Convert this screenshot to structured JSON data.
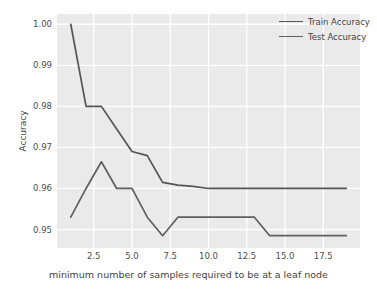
{
  "chart_data": {
    "type": "line",
    "title": "",
    "xlabel": "minimum number of samples required to be at a leaf node",
    "ylabel": "Accuracy",
    "xlim": [
      0.1,
      19.9
    ],
    "ylim": [
      0.9455,
      1.0025
    ],
    "grid": true,
    "legend_position": "upper right",
    "background": "#eaeaea",
    "gridline_color": "#ffffff",
    "xticks": [
      2.5,
      5.0,
      7.5,
      10.0,
      12.5,
      15.0,
      17.5
    ],
    "xtick_labels": [
      "2.5",
      "5.0",
      "7.5",
      "10.0",
      "12.5",
      "15.0",
      "17.5"
    ],
    "yticks": [
      0.95,
      0.96,
      0.97,
      0.98,
      0.99,
      1.0
    ],
    "ytick_labels": [
      "0.95",
      "0.96",
      "0.97",
      "0.98",
      "0.99",
      "1.00"
    ],
    "x": [
      1,
      2,
      3,
      4,
      5,
      6,
      7,
      8,
      9,
      10,
      11,
      12,
      13,
      14,
      15,
      16,
      17,
      18,
      19
    ],
    "series": [
      {
        "name": "Train Accuracy",
        "color": "#555555",
        "values": [
          1.0,
          0.98,
          0.98,
          0.9745,
          0.969,
          0.968,
          0.9615,
          0.9608,
          0.9605,
          0.96,
          0.96,
          0.96,
          0.96,
          0.96,
          0.96,
          0.96,
          0.96,
          0.96,
          0.96
        ]
      },
      {
        "name": "Test Accuracy",
        "color": "#5f5f5f",
        "values": [
          0.953,
          0.96,
          0.9665,
          0.96,
          0.96,
          0.953,
          0.9485,
          0.953,
          0.953,
          0.953,
          0.953,
          0.953,
          0.953,
          0.9485,
          0.9485,
          0.9485,
          0.9485,
          0.9485,
          0.9485
        ]
      }
    ]
  },
  "legend": {
    "entries": [
      {
        "label": "Train Accuracy",
        "color": "#555555"
      },
      {
        "label": "Test Accuracy",
        "color": "#5f5f5f"
      }
    ]
  },
  "axes": {
    "y_title": "Accuracy",
    "x_title": "minimum number of samples required to be at a leaf node"
  }
}
